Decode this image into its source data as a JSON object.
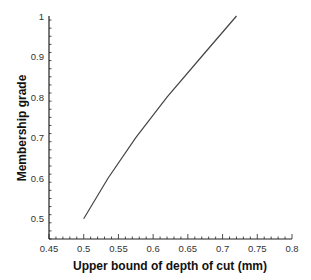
{
  "chart_data": {
    "type": "line",
    "title": "",
    "xlabel": "Upper bound of depth of cut (mm)",
    "ylabel": "Membership grade",
    "xlim": [
      0.45,
      0.8
    ],
    "ylim": [
      0.45,
      1.0
    ],
    "x_ticks": [
      "0.45",
      "0.5",
      "0.55",
      "0.6",
      "0.65",
      "0.7",
      "0.75",
      "0.8"
    ],
    "y_ticks": [
      "0.5",
      "0.6",
      "0.7",
      "0.8",
      "0.9",
      "1"
    ],
    "grid": false,
    "legend": null,
    "series": [
      {
        "name": "membership",
        "color": "#444444",
        "x": [
          0.5,
          0.535,
          0.575,
          0.62,
          0.67,
          0.72
        ],
        "y": [
          0.5,
          0.6,
          0.7,
          0.8,
          0.9,
          1.0
        ]
      }
    ]
  }
}
